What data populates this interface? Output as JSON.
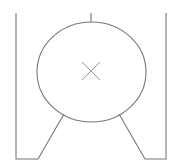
{
  "diagram": {
    "type": "technical-line-drawing",
    "stroke_color": "#777777",
    "cross_color": "#999999",
    "top_text_cropped": "",
    "shapes": {
      "circle": {
        "cx": 91.5,
        "cy": 72,
        "rx": 54.5,
        "ry": 50
      },
      "center_cross": {
        "cx": 91,
        "cy": 71,
        "half_size": 9
      },
      "top_tick": {
        "x": 91,
        "y1": 13,
        "y2": 22
      },
      "left_frame": [
        [
          16,
          13
        ],
        [
          16,
          159
        ],
        [
          38,
          159
        ],
        [
          64,
          114
        ]
      ],
      "right_frame": [
        [
          166,
          13
        ],
        [
          166,
          159
        ],
        [
          145,
          159
        ],
        [
          119,
          114
        ]
      ]
    }
  }
}
